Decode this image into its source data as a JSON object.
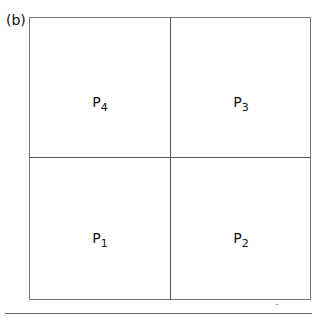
{
  "figure": {
    "panel_label": "(b)",
    "quadrants": [
      {
        "id": "top-left",
        "base": "P",
        "sub": "4"
      },
      {
        "id": "top-right",
        "base": "P",
        "sub": "3"
      },
      {
        "id": "bottom-left",
        "base": "P",
        "sub": "1"
      },
      {
        "id": "bottom-right",
        "base": "P",
        "sub": "2"
      }
    ]
  }
}
